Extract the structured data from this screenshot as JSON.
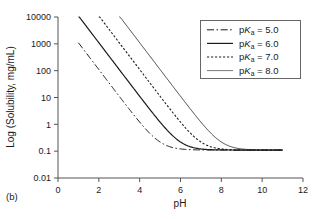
{
  "figure": {
    "panel_label": "(b)"
  },
  "chart_data": {
    "type": "line",
    "title": "",
    "subtitle": "",
    "xlabel": "pH",
    "ylabel": "Log (Solubility, mg/mL)",
    "xlim": [
      0,
      12
    ],
    "ylim": [
      0.01,
      10000
    ],
    "yscale": "log",
    "xticks": [
      "0",
      "2",
      "4",
      "6",
      "8",
      "10",
      "12"
    ],
    "xtick_values": [
      0,
      2,
      4,
      6,
      8,
      10,
      12
    ],
    "yticks": [
      "0.01",
      "0.1",
      "1",
      "10",
      "100",
      "1000",
      "10000"
    ],
    "ytick_values": [
      0.01,
      0.1,
      1,
      10,
      100,
      1000,
      10000
    ],
    "grid": false,
    "legend_position": "top-right",
    "intrinsic_solubility": 0.11,
    "series": [
      {
        "name": "pKa = 5.0",
        "label_prefix": "p",
        "label_italic": "K",
        "label_subscript": "a",
        "label_suffix": " = 5.0",
        "pka": 5.0,
        "style": "dash-dot",
        "dasharray": "7,2.5,1.6,2.5",
        "width": 1.0,
        "color": "#1a1a1a",
        "x_start": 1.0,
        "x_end": 11.0,
        "y_start": 1100,
        "x": [
          1.0,
          1.5,
          2.0,
          2.5,
          3.0,
          3.5,
          4.0,
          4.5,
          5.0,
          5.5,
          6.0,
          6.5,
          7.0,
          7.5,
          8.0,
          9.0,
          10.0,
          11.0
        ],
        "y": [
          1100,
          348,
          110,
          34.9,
          11.1,
          3.59,
          1.21,
          0.458,
          0.22,
          0.145,
          0.121,
          0.1135,
          0.1111,
          0.1103,
          0.1101,
          0.11,
          0.11,
          0.11
        ]
      },
      {
        "name": "pKa = 6.0",
        "label_prefix": "p",
        "label_italic": "K",
        "label_subscript": "a",
        "label_suffix": " = 6.0",
        "pka": 6.0,
        "style": "solid",
        "dasharray": "none",
        "width": 1.2,
        "color": "#1a1a1a",
        "x_start": 1.0,
        "x_end": 11.0,
        "y_start": 11000,
        "x": [
          1.0,
          1.5,
          2.0,
          2.5,
          3.0,
          3.5,
          4.0,
          4.5,
          5.0,
          5.5,
          6.0,
          6.5,
          7.0,
          7.5,
          8.0,
          9.0,
          10.0,
          11.0
        ],
        "y": [
          11000,
          3479,
          1100,
          348,
          110,
          34.9,
          11.1,
          3.59,
          1.21,
          0.458,
          0.22,
          0.145,
          0.121,
          0.1135,
          0.1111,
          0.1101,
          0.11,
          0.11
        ]
      },
      {
        "name": "pKa = 7.0",
        "label_prefix": "p",
        "label_italic": "K",
        "label_subscript": "a",
        "label_suffix": " = 7.0",
        "pka": 7.0,
        "style": "dotted",
        "dasharray": "2.2,1.8",
        "width": 1.1,
        "color": "#1a1a1a",
        "x_start": 2.0,
        "x_end": 11.0,
        "y_start": 11000,
        "x": [
          2.0,
          2.5,
          3.0,
          3.5,
          4.0,
          4.5,
          5.0,
          5.5,
          6.0,
          6.5,
          7.0,
          7.5,
          8.0,
          8.5,
          9.0,
          10.0,
          11.0
        ],
        "y": [
          11000,
          3479,
          1100,
          348,
          110,
          34.9,
          11.1,
          3.59,
          1.21,
          0.458,
          0.22,
          0.145,
          0.121,
          0.1135,
          0.1111,
          0.1101,
          0.11
        ]
      },
      {
        "name": "pKa = 8.0",
        "label_prefix": "p",
        "label_italic": "K",
        "label_subscript": "a",
        "label_suffix": " = 8.0",
        "pka": 8.0,
        "style": "solid-thin",
        "dasharray": "none",
        "width": 0.8,
        "color": "#555555",
        "x_start": 3.0,
        "x_end": 11.0,
        "y_start": 11000,
        "x": [
          3.0,
          3.5,
          4.0,
          4.5,
          5.0,
          5.5,
          6.0,
          6.5,
          7.0,
          7.5,
          8.0,
          8.5,
          9.0,
          9.5,
          10.0,
          10.5,
          11.0
        ],
        "y": [
          11000,
          3479,
          1100,
          348,
          110,
          34.9,
          11.1,
          3.59,
          1.21,
          0.458,
          0.22,
          0.145,
          0.121,
          0.1135,
          0.1111,
          0.1103,
          0.1101
        ]
      }
    ]
  }
}
